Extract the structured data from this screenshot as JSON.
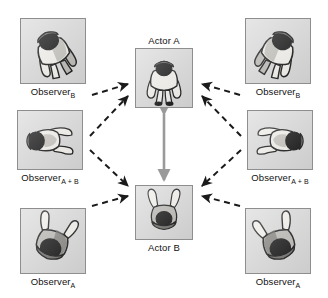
{
  "figure": {
    "canvas": {
      "width": 328,
      "height": 298,
      "background": "#ffffff"
    }
  },
  "palette": {
    "panel_fill": "#d9d9d9",
    "panel_border": "#8e8e8e",
    "dashed_arrow": "#1a1a1a",
    "solid_arrow": "#9a9a9a",
    "body_light": "#f2f0ec",
    "body_mid": "#b9b7b2",
    "body_dark": "#6e6c69",
    "head_black": "#121212",
    "outline": "#111111",
    "text": "#111111"
  },
  "nodes": [
    {
      "id": "observer-b-left",
      "label_text": "Observer",
      "label_sub": "B",
      "caption_pos": "below",
      "role": "observer",
      "view": "back-tilt-left",
      "x": 20,
      "y": 18,
      "w": 66,
      "h": 66,
      "mirror": false
    },
    {
      "id": "observer-ab-left",
      "label_text": "Observer",
      "label_sub": "A + B",
      "caption_pos": "below",
      "role": "observer",
      "view": "side-left",
      "x": 17,
      "y": 110,
      "w": 66,
      "h": 60,
      "mirror": false
    },
    {
      "id": "observer-a-left",
      "label_text": "Observer",
      "label_sub": "A",
      "caption_pos": "below",
      "role": "observer",
      "view": "front-tilt-left",
      "x": 20,
      "y": 208,
      "w": 66,
      "h": 66,
      "mirror": false
    },
    {
      "id": "observer-b-right",
      "label_text": "Observer",
      "label_sub": "B",
      "caption_pos": "below",
      "role": "observer",
      "view": "back-tilt-left",
      "x": 245,
      "y": 18,
      "w": 66,
      "h": 66,
      "mirror": true
    },
    {
      "id": "observer-ab-right",
      "label_text": "Observer",
      "label_sub": "A + B",
      "caption_pos": "below",
      "role": "observer",
      "view": "side-left",
      "x": 247,
      "y": 110,
      "w": 66,
      "h": 60,
      "mirror": true
    },
    {
      "id": "observer-a-right",
      "label_text": "Observer",
      "label_sub": "A",
      "caption_pos": "below",
      "role": "observer",
      "view": "front-tilt-left",
      "x": 245,
      "y": 208,
      "w": 66,
      "h": 66,
      "mirror": true
    },
    {
      "id": "actor-a",
      "label_text": "Actor A",
      "label_sub": "",
      "caption_pos": "above",
      "role": "actor",
      "view": "back-upright",
      "x": 135,
      "y": 48,
      "w": 58,
      "h": 60,
      "mirror": false
    },
    {
      "id": "actor-b",
      "label_text": "Actor B",
      "label_sub": "",
      "caption_pos": "below",
      "role": "actor",
      "view": "front-upright",
      "x": 135,
      "y": 185,
      "w": 58,
      "h": 55,
      "mirror": false
    }
  ],
  "links": {
    "dashed": [
      {
        "from": "observer-b-left",
        "to": "actor-a",
        "x1": 92,
        "y1": 95,
        "x2": 128,
        "y2": 84
      },
      {
        "from": "observer-ab-left",
        "to": "actor-a",
        "x1": 90,
        "y1": 136,
        "x2": 128,
        "y2": 96
      },
      {
        "from": "observer-ab-left",
        "to": "actor-b",
        "x1": 90,
        "y1": 150,
        "x2": 128,
        "y2": 186
      },
      {
        "from": "observer-a-left",
        "to": "actor-b",
        "x1": 92,
        "y1": 206,
        "x2": 128,
        "y2": 196
      },
      {
        "from": "observer-b-right",
        "to": "actor-a",
        "x1": 240,
        "y1": 95,
        "x2": 202,
        "y2": 84
      },
      {
        "from": "observer-ab-right",
        "to": "actor-a",
        "x1": 241,
        "y1": 136,
        "x2": 202,
        "y2": 96
      },
      {
        "from": "observer-ab-right",
        "to": "actor-b",
        "x1": 241,
        "y1": 150,
        "x2": 202,
        "y2": 186
      },
      {
        "from": "observer-a-right",
        "to": "actor-b",
        "x1": 240,
        "y1": 206,
        "x2": 202,
        "y2": 196
      }
    ],
    "solid_double": [
      {
        "from": "actor-a",
        "to": "actor-b",
        "x1": 164,
        "y1": 114,
        "x2": 164,
        "y2": 180
      }
    ]
  }
}
